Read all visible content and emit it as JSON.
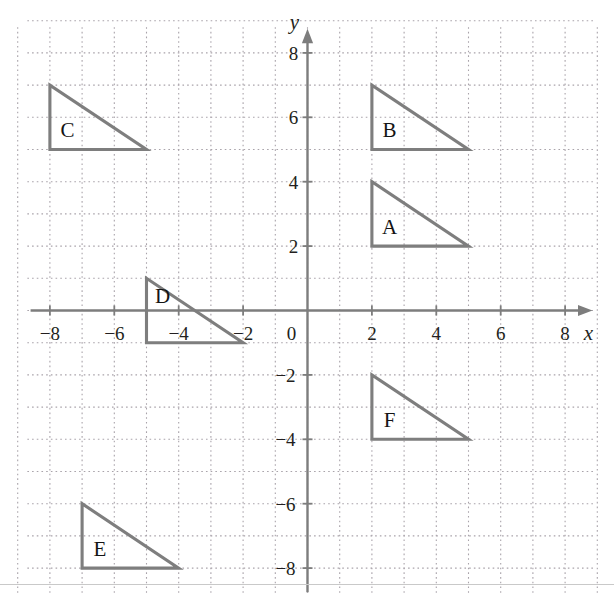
{
  "figure": {
    "title": "",
    "background_color": "#ffffff",
    "grid_color": "#a9a3aa",
    "axis_color": "#7d7d7d",
    "shape_color": "#7e7e7e",
    "label_color": "#231f20"
  },
  "axes": {
    "x_axis_name": "x",
    "y_axis_name": "y",
    "origin_label": "0",
    "x_ticks": [
      {
        "value": -8,
        "label": "−8"
      },
      {
        "value": -6,
        "label": "−6"
      },
      {
        "value": -4,
        "label": "−4"
      },
      {
        "value": -2,
        "label": "−2"
      },
      {
        "value": 2,
        "label": "2"
      },
      {
        "value": 4,
        "label": "4"
      },
      {
        "value": 6,
        "label": "6"
      },
      {
        "value": 8,
        "label": "8"
      }
    ],
    "y_ticks": [
      {
        "value": 8,
        "label": "8"
      },
      {
        "value": 6,
        "label": "6"
      },
      {
        "value": 4,
        "label": "4"
      },
      {
        "value": 2,
        "label": "2"
      },
      {
        "value": -2,
        "label": "−2"
      },
      {
        "value": -4,
        "label": "−4"
      },
      {
        "value": -6,
        "label": "−6"
      },
      {
        "value": -8,
        "label": "−8"
      }
    ]
  },
  "chart_data": {
    "type": "scatter",
    "title": "",
    "xlabel": "x",
    "ylabel": "y",
    "xlim": [
      -9,
      9
    ],
    "ylim": [
      -9,
      9
    ],
    "xticks": [
      -8,
      -6,
      -4,
      -2,
      0,
      2,
      4,
      6,
      8
    ],
    "yticks": [
      -8,
      -6,
      -4,
      -2,
      0,
      2,
      4,
      6,
      8
    ],
    "grid": true,
    "grid_spacing": 1,
    "grid_style": "dotted",
    "legend": "none",
    "shapes": [
      {
        "name": "A",
        "kind": "right-triangle",
        "label": "A",
        "label_at": [
          2.55,
          2.6
        ],
        "vertices": [
          [
            2,
            4
          ],
          [
            2,
            2
          ],
          [
            5,
            2
          ]
        ],
        "width": 3,
        "height": 2
      },
      {
        "name": "B",
        "kind": "right-triangle",
        "label": "B",
        "label_at": [
          2.55,
          5.6
        ],
        "vertices": [
          [
            2,
            7
          ],
          [
            2,
            5
          ],
          [
            5,
            5
          ]
        ],
        "width": 3,
        "height": 2
      },
      {
        "name": "C",
        "kind": "right-triangle",
        "label": "C",
        "label_at": [
          -7.45,
          5.6
        ],
        "vertices": [
          [
            -8,
            7
          ],
          [
            -8,
            5
          ],
          [
            -5,
            5
          ]
        ],
        "width": 3,
        "height": 2
      },
      {
        "name": "D",
        "kind": "right-triangle",
        "label": "D",
        "label_at": [
          -4.5,
          0.45
        ],
        "vertices": [
          [
            -5,
            1
          ],
          [
            -5,
            -1
          ],
          [
            -2,
            -1
          ]
        ],
        "width": 3,
        "height": 2
      },
      {
        "name": "E",
        "kind": "right-triangle",
        "label": "E",
        "label_at": [
          -6.45,
          -7.4
        ],
        "vertices": [
          [
            -7,
            -6
          ],
          [
            -7,
            -8
          ],
          [
            -4,
            -8
          ]
        ],
        "width": 3,
        "height": 2
      },
      {
        "name": "F",
        "kind": "right-triangle",
        "label": "F",
        "label_at": [
          2.55,
          -3.4
        ],
        "vertices": [
          [
            2,
            -2
          ],
          [
            2,
            -4
          ],
          [
            5,
            -4
          ]
        ],
        "width": 3,
        "height": 2
      }
    ]
  }
}
